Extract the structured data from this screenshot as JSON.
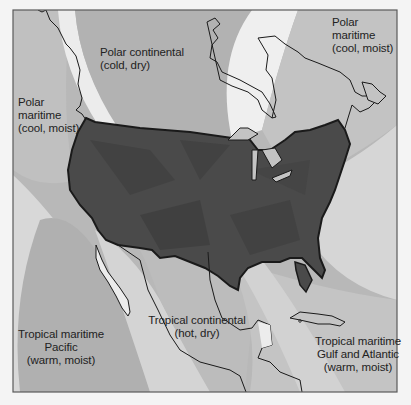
{
  "map": {
    "title": "North American air masses",
    "colors": {
      "page_bg": "#f4f4f4",
      "frame_bg": "#b8b8b8",
      "polar_continental": "#b3b3b3",
      "polar_maritime": "#c2c2c2",
      "tropical_maritime_pacific": "#b0b0b0",
      "tropical_continental": "#bdbdbd",
      "tropical_maritime_gulf": "#c4c4c4",
      "gap": "#efefef",
      "us_fill": "#4a4a4a",
      "outline": "#1a1a1a"
    },
    "labels": {
      "polar_continental": {
        "line1": "Polar continental",
        "line2": "(cold, dry)"
      },
      "polar_maritime_pacific": {
        "line1": "Polar",
        "line2": "maritime",
        "line3": "(cool, moist)"
      },
      "polar_maritime_atlantic": {
        "line1": "Polar",
        "line2": "maritime",
        "line3": "(cool, moist)"
      },
      "tropical_maritime_pacific": {
        "line1": "Tropical maritime",
        "line2": "Pacific",
        "line3": "(warm, moist)"
      },
      "tropical_continental": {
        "line1": "Tropical continental",
        "line2": "(hot, dry)"
      },
      "tropical_maritime_gulf": {
        "line1": "Tropical maritime",
        "line2": "Gulf and Atlantic",
        "line3": "(warm, moist)"
      }
    }
  }
}
